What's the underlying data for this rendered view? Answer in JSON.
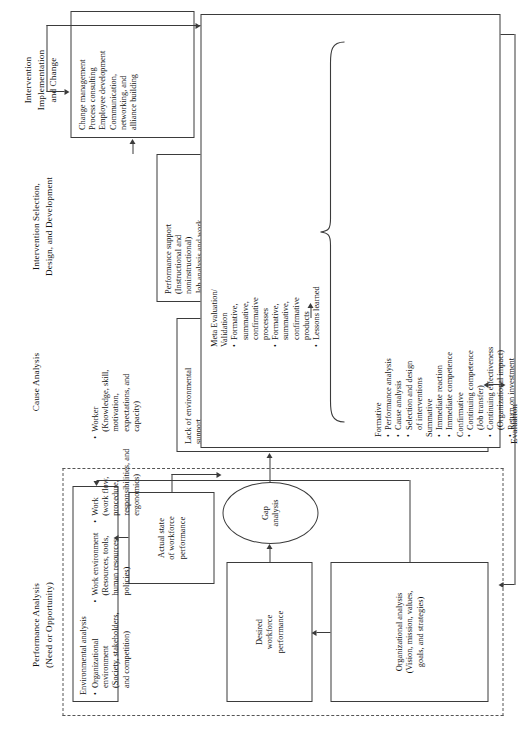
{
  "figure": {
    "title_columns": [
      {
        "id": "performance-analysis",
        "lines": [
          "Performance Analysis",
          "(Need or Opportunity)"
        ]
      },
      {
        "id": "cause-analysis",
        "lines": [
          "Cause Analysis"
        ]
      },
      {
        "id": "intervention-selection",
        "lines": [
          "Intervention Selection,",
          "Design, and Development"
        ]
      },
      {
        "id": "intervention-implementation",
        "lines": [
          "Intervention",
          "Implementation",
          "and Change"
        ]
      }
    ],
    "evaluation_label": "Evaluation",
    "boxes": {
      "organizational_analysis": {
        "lines": [
          "Organizational analysis",
          "(Vision, mission, values,",
          "goals, and strategies)"
        ]
      },
      "desired_workforce_performance": {
        "lines": [
          "Desired",
          "workforce",
          "performance"
        ]
      },
      "gap_analysis": {
        "lines": [
          "Gap",
          "analysis"
        ]
      },
      "actual_state_workforce_performance": {
        "lines": [
          "Actual state",
          "of workforce",
          "performance"
        ]
      },
      "environmental_analysis": {
        "heading": "Environmental analysis",
        "items": [
          {
            "bullet": true,
            "lines": [
              "Organizational",
              "environment",
              "(Society, stakeholders,",
              "and competition)"
            ]
          },
          {
            "bullet": true,
            "lines": [
              "Work environment",
              "(Resources, tools,",
              "human resources",
              "policies)"
            ]
          },
          {
            "bullet": true,
            "lines": [
              "Work",
              "(work flow,",
              "procedure,",
              "responsibilities, and",
              "ergonomics)"
            ]
          },
          {
            "bullet": true,
            "lines": [
              "Worker",
              "(Knowledge, skill,",
              "motivation,",
              "expectations, and",
              "capacity)"
            ]
          }
        ]
      },
      "cause_analysis": {
        "items": [
          {
            "bullet": false,
            "lines": [
              "Lack of environmental",
              "support"
            ]
          },
          {
            "bullet": true,
            "lines": [
              "Data, information,",
              "and feedback"
            ]
          },
          {
            "bullet": true,
            "lines": [
              "Environment support,",
              "resources, and tools"
            ]
          },
          {
            "bullet": true,
            "lines": [
              "Consequences,",
              "incentives, or rewards"
            ]
          },
          {
            "bullet": false,
            "lines": [
              "Lack of repertory of",
              "behavior"
            ]
          },
          {
            "bullet": true,
            "lines": [
              "Skills and knowledge"
            ]
          },
          {
            "bullet": true,
            "lines": [
              "Individual capacity"
            ]
          },
          {
            "bullet": true,
            "lines": [
              "Motivation and",
              "expectations"
            ]
          }
        ]
      },
      "intervention_selection": {
        "items": [
          {
            "bullet": false,
            "lines": [
              "Performance support",
              "(Instructional and",
              "noninstructional)"
            ]
          },
          {
            "bullet": false,
            "lines": [
              "Job analysis and work",
              "design"
            ]
          },
          {
            "bullet": false,
            "lines": [
              "Personal development"
            ]
          },
          {
            "bullet": false,
            "lines": [
              "Human resource",
              "development"
            ]
          },
          {
            "bullet": false,
            "lines": [
              "Organizational",
              "communication"
            ]
          },
          {
            "bullet": false,
            "lines": [
              "Organizational design",
              "and development"
            ]
          },
          {
            "bullet": false,
            "lines": [
              "Financial systems"
            ]
          }
        ]
      },
      "intervention_implementation": {
        "items": [
          {
            "bullet": false,
            "lines": [
              "Change management"
            ]
          },
          {
            "bullet": false,
            "lines": [
              "Process consulting"
            ]
          },
          {
            "bullet": false,
            "lines": [
              "Employee development"
            ]
          },
          {
            "bullet": false,
            "lines": [
              "Communication,",
              "networking, and",
              "alliance building"
            ]
          }
        ]
      },
      "evaluation_formative_summative": {
        "items": [
          {
            "bullet": false,
            "lines": [
              "Formative"
            ]
          },
          {
            "bullet": true,
            "lines": [
              "Performance analysis"
            ]
          },
          {
            "bullet": true,
            "lines": [
              "Cause analysis"
            ]
          },
          {
            "bullet": true,
            "lines": [
              "Selection and design",
              "of interventions"
            ]
          },
          {
            "bullet": false,
            "lines": [
              "Summative"
            ]
          },
          {
            "bullet": true,
            "lines": [
              "Immediate reaction"
            ]
          },
          {
            "bullet": true,
            "lines": [
              "Immediate competence"
            ]
          },
          {
            "bullet": false,
            "lines": [
              "Confirmative"
            ]
          },
          {
            "bullet": true,
            "lines": [
              "Continuing competence",
              "(Job transfer)"
            ]
          },
          {
            "bullet": true,
            "lines": [
              "Continuing effectiveness",
              "(Organizational impact)"
            ]
          },
          {
            "bullet": true,
            "lines": [
              "Return on investment"
            ]
          }
        ]
      },
      "meta_evaluation": {
        "items": [
          {
            "bullet": false,
            "lines": [
              "Meta Evaluation/",
              "Validation"
            ]
          },
          {
            "bullet": true,
            "lines": [
              "Formative,",
              "summative,",
              "confirmative",
              "processes"
            ]
          },
          {
            "bullet": true,
            "lines": [
              "Formative,",
              "summative,",
              "confirmative",
              "products"
            ]
          },
          {
            "bullet": true,
            "lines": [
              "Lessons learned"
            ]
          }
        ]
      }
    },
    "colors": {
      "stroke": "#3b3b3b",
      "dashed_stroke": "#555555",
      "background": "#ffffff",
      "text": "#111111"
    }
  }
}
